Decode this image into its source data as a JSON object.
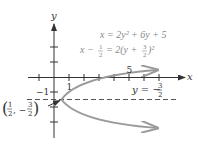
{
  "diagram": {
    "type": "parabola-graph",
    "colors": {
      "axis": "#333333",
      "curve": "#9a9a9a",
      "dashed": "#555555",
      "equation_text": "#888888",
      "label_text": "#333333"
    },
    "axes": {
      "x_label": "x",
      "y_label": "y",
      "x_tick_labels": {
        "1": "1",
        "5": "5"
      },
      "y_tick_labels": {
        "-1": "−1"
      }
    },
    "equations": {
      "line1": "x = 2y² + 6y + 5",
      "line2_lhs": "x −",
      "line2_frac_num": "1",
      "line2_frac_den": "2",
      "line2_mid": "= 2(y +",
      "line2_frac2_num": "3",
      "line2_frac2_den": "2",
      "line2_end": ")²"
    },
    "axis_of_symmetry": {
      "label_lhs": "y = −",
      "frac_num": "3",
      "frac_den": "2"
    },
    "vertex": {
      "label_open": "(",
      "x_num": "1",
      "x_den": "2",
      "sep": ", −",
      "y_num": "3",
      "y_den": "2",
      "label_close": ")"
    }
  }
}
